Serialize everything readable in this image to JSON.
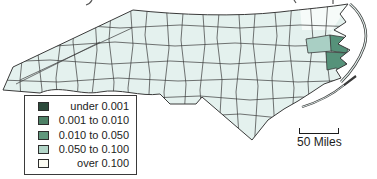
{
  "map": {
    "kind": "choropleth-county-map",
    "scale_bar": {
      "label": "50 Miles"
    }
  },
  "legend": {
    "items": [
      {
        "label": "under 0.001",
        "color": "#2c4a3b"
      },
      {
        "label": "0.001 to 0.010",
        "color": "#4e8166"
      },
      {
        "label": "0.010 to 0.050",
        "color": "#5f977c"
      },
      {
        "label": "0.050 to 0.100",
        "color": "#b2d5c8"
      },
      {
        "label": "over 0.100",
        "color": "#fcfcf3"
      }
    ]
  },
  "colors": {
    "county_fill": "#e4f1ee",
    "county_fill_light": "#f6fbf9",
    "border": "#3a3a3a",
    "highlight_medium": "#56927a",
    "highlight_light": "#a9cfc4",
    "water": "#ffffff"
  }
}
